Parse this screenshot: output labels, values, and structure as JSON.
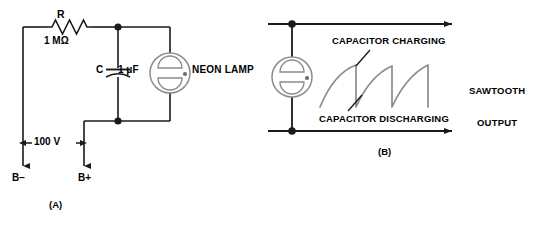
{
  "figure": {
    "panel_a": {
      "caption": "(A)",
      "resistor_label": "R",
      "resistor_value": "1 MΩ",
      "capacitor_label": "C",
      "capacitor_value": "1 μF",
      "lamp_label": "NEON LAMP",
      "voltage_label": "100 V",
      "terminal_negative": "B−",
      "terminal_positive": "B+",
      "components": [
        {
          "name": "resistor",
          "label": "R",
          "value": "1 MΩ"
        },
        {
          "name": "capacitor",
          "label": "C",
          "value": "1 μF"
        },
        {
          "name": "neon-lamp",
          "label": "NEON LAMP"
        },
        {
          "name": "supply",
          "label": "100 V"
        }
      ]
    },
    "panel_b": {
      "caption": "(B)",
      "charging_label": "CAPACITOR CHARGING",
      "discharging_label": "CAPACITOR DISCHARGING",
      "output_label_line1": "SAWTOOTH",
      "output_label_line2": "OUTPUT",
      "waveform": {
        "type": "sawtooth",
        "cycles": 3,
        "rise": "exponential-charge",
        "fall": "vertical-discharge"
      }
    },
    "colors": {
      "wire": "#1a1a1a",
      "lamp_outline": "#8c8c8c",
      "waveform": "#8c8c8c",
      "background": "#ffffff"
    }
  }
}
